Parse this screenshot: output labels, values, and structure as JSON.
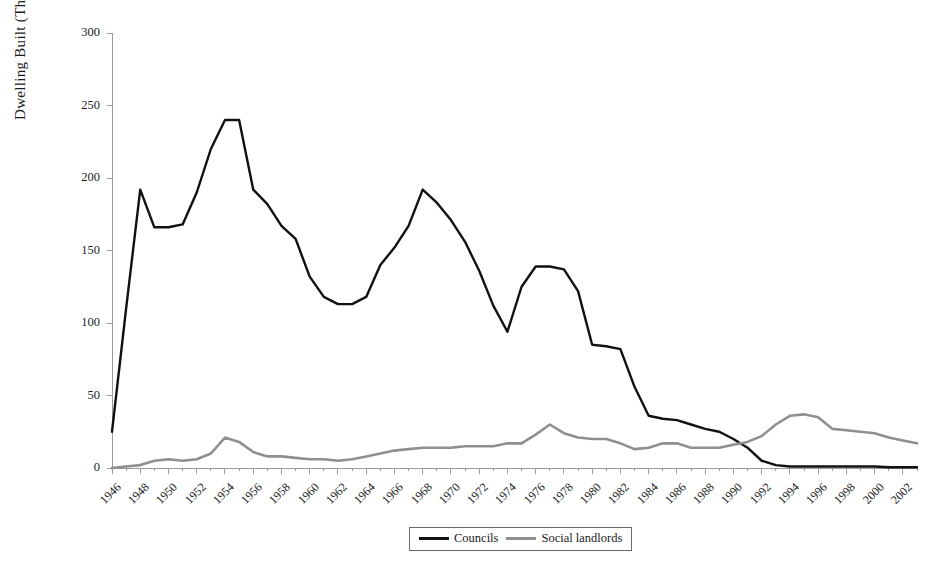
{
  "chart_data": {
    "type": "line",
    "title": "",
    "xlabel": "",
    "ylabel": "Dwelling Built (Thousands)",
    "xlim": [
      1946,
      2003
    ],
    "ylim": [
      0,
      300
    ],
    "yticks": [
      0,
      50,
      100,
      150,
      200,
      250,
      300
    ],
    "xticks": [
      1946,
      1948,
      1950,
      1952,
      1954,
      1956,
      1958,
      1960,
      1962,
      1964,
      1966,
      1968,
      1970,
      1972,
      1974,
      1976,
      1978,
      1980,
      1982,
      1984,
      1986,
      1988,
      1990,
      1992,
      1994,
      1996,
      1998,
      2000,
      2002
    ],
    "xtick_labels": [
      "1946",
      "1948",
      "1950",
      "1952",
      "1954",
      "1956",
      "1958",
      "1960",
      "1962",
      "1964",
      "1966",
      "1968",
      "1970",
      "1972",
      "1974",
      "1976",
      "1978",
      "1980",
      "1982",
      "1984",
      "1986",
      "1988",
      "1990",
      "1992",
      "1994",
      "1996",
      "1998",
      "2000",
      "2002"
    ],
    "ytick_labels": [
      "0",
      "50",
      "100",
      "150",
      "200",
      "250",
      "300"
    ],
    "grid": false,
    "legend_position": "bottom-center",
    "x": [
      1946,
      1947,
      1948,
      1949,
      1950,
      1951,
      1952,
      1953,
      1954,
      1955,
      1956,
      1957,
      1958,
      1959,
      1960,
      1961,
      1962,
      1963,
      1964,
      1965,
      1966,
      1967,
      1968,
      1969,
      1970,
      1971,
      1972,
      1973,
      1974,
      1975,
      1976,
      1977,
      1978,
      1979,
      1980,
      1981,
      1982,
      1983,
      1984,
      1985,
      1986,
      1987,
      1988,
      1989,
      1990,
      1991,
      1992,
      1993,
      1994,
      1995,
      1996,
      1997,
      1998,
      1999,
      2000,
      2001,
      2002,
      2003
    ],
    "series": [
      {
        "name": "Councils",
        "color": "#111111",
        "values": [
          25,
          110,
          192,
          166,
          166,
          168,
          190,
          220,
          240,
          240,
          192,
          182,
          167,
          158,
          132,
          118,
          113,
          113,
          118,
          140,
          152,
          167,
          192,
          183,
          171,
          156,
          136,
          112,
          94,
          125,
          139,
          139,
          137,
          122,
          85,
          84,
          82,
          56,
          36,
          34,
          33,
          30,
          27,
          25,
          20,
          14,
          5,
          2,
          1,
          1,
          1,
          1,
          1,
          1,
          1,
          0.5,
          0.5,
          0.5
        ]
      },
      {
        "name": "Social landlords",
        "color": "#8f8f8f",
        "values": [
          0,
          1,
          2,
          5,
          6,
          5,
          6,
          10,
          21,
          18,
          11,
          8,
          8,
          7,
          6,
          6,
          5,
          6,
          8,
          10,
          12,
          13,
          14,
          14,
          14,
          15,
          15,
          15,
          17,
          17,
          23,
          30,
          24,
          21,
          20,
          20,
          17,
          13,
          14,
          17,
          17,
          14,
          14,
          14,
          16,
          18,
          22,
          30,
          36,
          37,
          35,
          27,
          26,
          25,
          24,
          21,
          19,
          17
        ]
      }
    ],
    "legend": [
      {
        "label": "Councils",
        "swatch": "councils"
      },
      {
        "label": "Social landlords",
        "swatch": "landlords"
      }
    ]
  }
}
